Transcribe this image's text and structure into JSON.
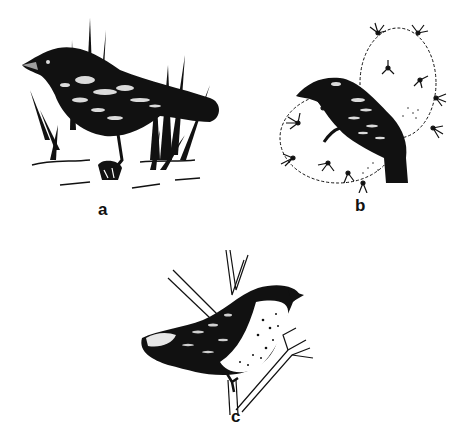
{
  "figure": {
    "panels": [
      {
        "id": "a",
        "label": "a",
        "description": "dark ground finch standing in grass",
        "perch": "grass tufts"
      },
      {
        "id": "b",
        "label": "b",
        "description": "dark finch perched on prickly pear cactus",
        "perch": "cactus pads"
      },
      {
        "id": "c",
        "label": "c",
        "description": "speckled finch perched on forked branch",
        "perch": "tree branch"
      }
    ],
    "colors": {
      "ink": "#111111",
      "paper": "#ffffff"
    }
  }
}
